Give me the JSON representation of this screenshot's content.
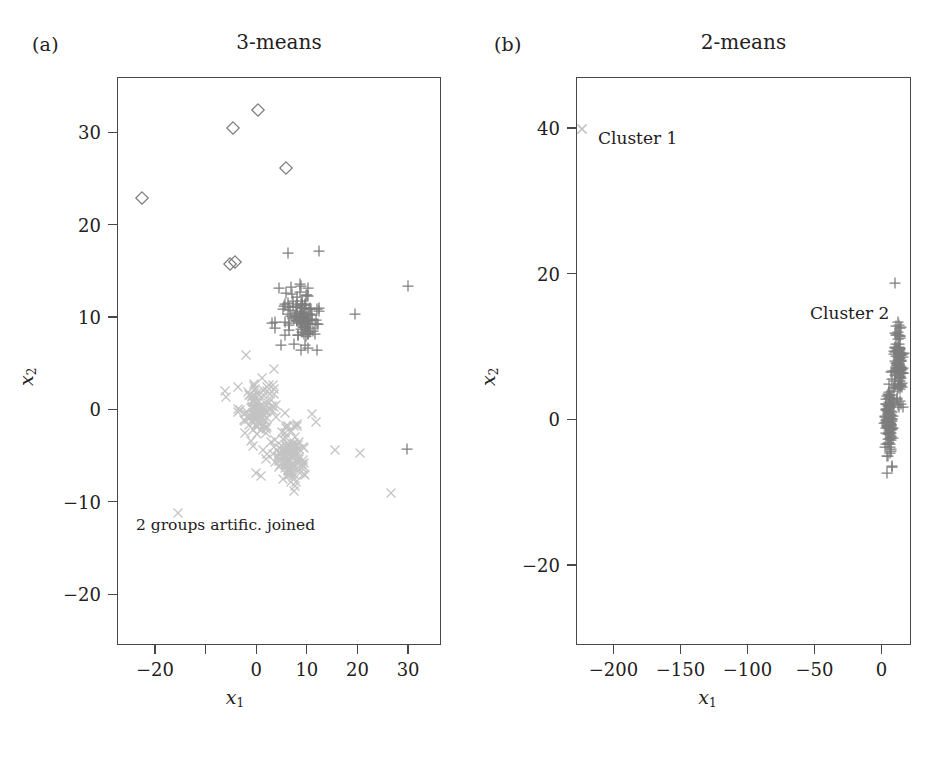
{
  "figure": {
    "panels": [
      {
        "letter": "(a)",
        "title": "3-means",
        "xlabel": "x",
        "xlabel_sub": "1",
        "ylabel": "x",
        "ylabel_sub": "2",
        "annotation": "2 groups artific. joined"
      },
      {
        "letter": "(b)",
        "title": "2-means",
        "xlabel": "x",
        "xlabel_sub": "1",
        "ylabel": "x",
        "ylabel_sub": "2",
        "legend_cluster1": "Cluster 1",
        "legend_cluster2": "Cluster 2"
      }
    ]
  },
  "colors": {
    "frame": "#4a4749",
    "text": "#242021",
    "cross_light": "#c3c3c3",
    "plus_dark": "#7d7d7d",
    "diamond": "#7b7b7b"
  },
  "chart_data": [
    {
      "type": "scatter",
      "panel": "(a)",
      "title": "3-means",
      "xlabel": "x1",
      "ylabel": "x2",
      "xlim": [
        -27.5,
        36.5
      ],
      "ylim": [
        -25.5,
        36.0
      ],
      "xticks": [
        -20,
        -10,
        0,
        10,
        20,
        30
      ],
      "xticklabels": [
        "-20",
        "",
        "0",
        "10",
        "20",
        "30"
      ],
      "yticks": [
        30,
        20,
        10,
        0,
        -10,
        -20
      ],
      "yticklabels": [
        "30",
        "20",
        "10",
        "0",
        "-10",
        "-20"
      ],
      "grid": false,
      "legend": "none",
      "annotations": [
        {
          "text": "2 groups artific. joined",
          "x": -19.5,
          "y": -12.8
        }
      ],
      "series": [
        {
          "name": "Cluster diamonds",
          "marker": "diamond",
          "color": "#7b7b7b",
          "points": [
            [
              -22.8,
              23.0
            ],
            [
              -4.8,
              30.6
            ],
            [
              0.2,
              32.5
            ],
            [
              5.6,
              26.3
            ],
            [
              -5.4,
              15.9
            ],
            [
              -4.3,
              16.1
            ]
          ]
        },
        {
          "name": "Cluster plus",
          "marker": "plus",
          "color": "#7d7d7d",
          "scattered_points": [
            [
              12.2,
              17.3
            ],
            [
              4.3,
              13.3
            ],
            [
              29.8,
              13.5
            ],
            [
              19.3,
              10.5
            ],
            [
              29.5,
              -4.2
            ]
          ],
          "dense_blob": {
            "cx": 8.6,
            "cy": 10.2,
            "sx": 1.9,
            "sy": 1.6,
            "n": 120
          }
        },
        {
          "name": "Cluster crosses",
          "marker": "cross",
          "color": "#c3c3c3",
          "scattered_points": [
            [
              -2.3,
              6.0
            ],
            [
              -6.3,
              2.1
            ],
            [
              -6.1,
              1.5
            ],
            [
              10.9,
              -0.4
            ],
            [
              15.4,
              -4.3
            ],
            [
              20.3,
              -4.6
            ],
            [
              26.5,
              -8.9
            ],
            [
              -15.7,
              -11.1
            ]
          ],
          "dense_blobs": [
            {
              "cx": 0.2,
              "cy": -0.2,
              "sx": 1.6,
              "sy": 1.7,
              "n": 110
            },
            {
              "cx": 6.6,
              "cy": -4.9,
              "sx": 1.8,
              "sy": 1.7,
              "n": 110
            }
          ]
        }
      ]
    },
    {
      "type": "scatter",
      "panel": "(b)",
      "title": "2-means",
      "xlabel": "x1",
      "ylabel": "x2",
      "xlim": [
        -228,
        22
      ],
      "ylim": [
        -31,
        47
      ],
      "xticks": [
        -200,
        -150,
        -100,
        -50,
        0
      ],
      "xticklabels": [
        "-200",
        "-150",
        "-100",
        "-50",
        "0"
      ],
      "yticks": [
        40,
        20,
        0,
        -20
      ],
      "yticklabels": [
        "40",
        "20",
        "0",
        "-20"
      ],
      "grid": false,
      "legend": "inline-labels",
      "annotations": [
        {
          "text": "Cluster 1",
          "x": -218,
          "y": 40
        },
        {
          "text": "Cluster 2",
          "x": -26,
          "y": 14.5
        }
      ],
      "series": [
        {
          "name": "Cluster 1",
          "marker": "cross",
          "color": "#c3c3c3",
          "points": [
            [
              -224.5,
              40.0
            ]
          ]
        },
        {
          "name": "Cluster 2",
          "marker": "plus",
          "color": "#7d7d7d",
          "dense_blobs": [
            {
              "cx": 12.0,
              "cy": 7.8,
              "sx": 1.9,
              "sy": 2.6,
              "n": 130
            },
            {
              "cx": 5.0,
              "cy": 0.2,
              "sx": 1.8,
              "sy": 2.4,
              "n": 130
            }
          ]
        }
      ]
    }
  ]
}
